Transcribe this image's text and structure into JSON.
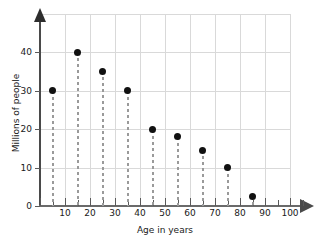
{
  "chart_data": {
    "type": "scatter",
    "title": "",
    "xlabel": "Age in years",
    "ylabel": "Millions of people",
    "x": [
      5,
      15,
      25,
      35,
      45,
      55,
      65,
      75,
      85
    ],
    "values": [
      30,
      40,
      35,
      30,
      19.8,
      18,
      14.5,
      10,
      2.5
    ],
    "xlim": [
      0,
      110
    ],
    "ylim": [
      0,
      48
    ],
    "xticks": [
      0,
      10,
      20,
      30,
      40,
      50,
      60,
      70,
      80,
      90,
      100
    ],
    "xtick_labels": [
      "",
      "10",
      "20",
      "30",
      "40",
      "50",
      "60",
      "70",
      "80",
      "90",
      "100"
    ],
    "yticks": [
      0,
      10,
      20,
      30,
      40
    ],
    "ytick_labels": [
      "0",
      "10",
      "20",
      "30",
      "40"
    ],
    "grid": true,
    "legend": "none",
    "marker_color": "#111111",
    "stem_color": "#9a9a9a",
    "grid_color": "#d9d9d9",
    "axis_color": "#4a4a4a"
  }
}
